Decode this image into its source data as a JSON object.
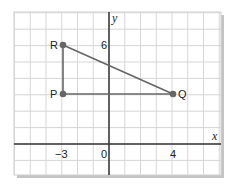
{
  "diagram": {
    "type": "coordinate-grid",
    "x_axis_label": "x",
    "y_axis_label": "y",
    "x_range": [
      -6,
      7
    ],
    "y_range": [
      -2,
      8
    ],
    "tick_labels": {
      "x_neg3": "−3",
      "origin": "0",
      "x_4": "4",
      "y_6": "6"
    },
    "points": [
      {
        "label": "R",
        "x": -3,
        "y": 6
      },
      {
        "label": "P",
        "x": -3,
        "y": 3
      },
      {
        "label": "Q",
        "x": 4,
        "y": 3
      }
    ],
    "segments": [
      [
        "R",
        "P"
      ],
      [
        "P",
        "Q"
      ],
      [
        "R",
        "Q"
      ]
    ],
    "colors": {
      "grid": "#d4d4d4",
      "axis": "#333333",
      "segment": "#666666",
      "point": "#666666",
      "shadow": "#bdbdbd"
    }
  }
}
